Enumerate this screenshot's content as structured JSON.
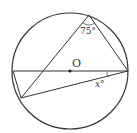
{
  "diagram": {
    "type": "circle-geometry",
    "center_label": "O",
    "angle_label_top": "75°",
    "angle_label_unknown": "x°",
    "colors": {
      "stroke": "#333333",
      "background": "#ffffff"
    },
    "points": {
      "center": [
        70,
        71
      ],
      "diameter_left": [
        13,
        71
      ],
      "diameter_right": [
        128,
        71
      ],
      "top": [
        89,
        15
      ],
      "lower_left": [
        21,
        98
      ]
    },
    "radius": 58
  }
}
